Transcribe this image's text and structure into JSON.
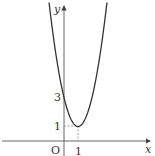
{
  "chart_data": {
    "type": "line",
    "title": "",
    "function": "y = 2(x-1)^2 + 1",
    "xlabel": "x",
    "ylabel": "y",
    "origin_label": "O",
    "x_ticks": [
      {
        "value": 1,
        "label": "1"
      }
    ],
    "y_ticks": [
      {
        "value": 1,
        "label": "1"
      },
      {
        "value": 3,
        "label": "3"
      }
    ],
    "vertex": {
      "x": 1,
      "y": 1
    },
    "y_intercept": {
      "x": 0,
      "y": 3
    },
    "dashed_guides": [
      {
        "from": [
          0,
          1
        ],
        "to": [
          1,
          1
        ]
      },
      {
        "from": [
          1,
          0
        ],
        "to": [
          1,
          1
        ]
      }
    ],
    "xlim": [
      -4.5,
      6.5
    ],
    "ylim": [
      -1,
      9.7
    ],
    "grid": false,
    "colors": {
      "curve": "#333333",
      "axes": "#444444"
    }
  }
}
